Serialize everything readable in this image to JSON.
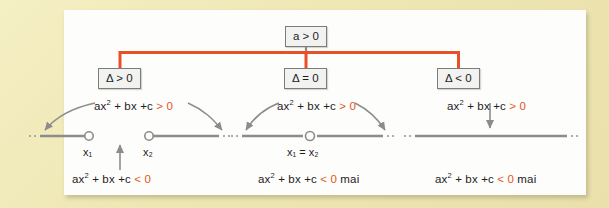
{
  "diagram": {
    "title_node": {
      "label": "a > 0"
    },
    "branches": [
      {
        "condition": "Δ > 0",
        "positive_expr_prefix": "ax",
        "positive_expr_mid": " + bx +c ",
        "positive_expr_rel": "> 0",
        "negative_expr_prefix": "ax",
        "negative_expr_mid": " + bx +c ",
        "negative_expr_rel": "< 0",
        "negative_expr_suffix": "",
        "root_labels": [
          "x₁",
          "x₂"
        ]
      },
      {
        "condition": "Δ = 0",
        "positive_expr_prefix": "ax",
        "positive_expr_mid": " + bx +c ",
        "positive_expr_rel": "> 0",
        "negative_expr_prefix": "ax",
        "negative_expr_mid": " + bx +c ",
        "negative_expr_rel": "< 0",
        "negative_expr_suffix": " mai",
        "root_labels": [
          "x₁ = x₂"
        ]
      },
      {
        "condition": "Δ < 0",
        "positive_expr_prefix": "ax",
        "positive_expr_mid": " + bx +c ",
        "positive_expr_rel": "> 0",
        "negative_expr_prefix": "ax",
        "negative_expr_mid": " + bx +c ",
        "negative_expr_rel": "< 0",
        "negative_expr_suffix": " mai",
        "root_labels": []
      }
    ],
    "exponent": "2",
    "colors": {
      "connector": "#e8502a",
      "stub": "#8a8a8a",
      "accent_text": "#e2561f",
      "axis": "#8c8c8c",
      "node_border": "#7c7c7c",
      "frame": "#efe8b8",
      "panel": "#fdfdfb"
    }
  }
}
